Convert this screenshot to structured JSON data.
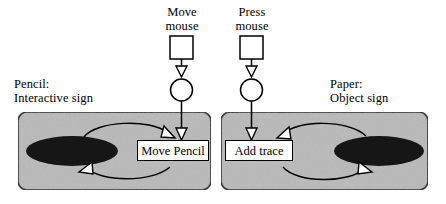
{
  "diagram": {
    "colors": {
      "panel_fill": "#b9b9b9",
      "panel_stroke": "#1a1a1a",
      "ellipse_fill": "#161616",
      "box_fill": "#ffffff",
      "stroke": "#000000"
    },
    "external_events": [
      {
        "id": "move-mouse",
        "label_line1": "Move",
        "label_line2": "mouse",
        "shapes": [
          "square",
          "arrow-down",
          "circle",
          "arrow-down"
        ]
      },
      {
        "id": "press-mouse",
        "label_line1": "Press",
        "label_line2": "mouse",
        "shapes": [
          "square",
          "arrow-down",
          "circle",
          "arrow-down"
        ]
      }
    ],
    "panels": [
      {
        "id": "pencil",
        "label_line1": "Pencil:",
        "label_line2": "Interactive sign",
        "ellipse_side": "left",
        "action_label": "Move Pencil"
      },
      {
        "id": "paper",
        "label_line1": "Paper:",
        "label_line2": "Object sign",
        "ellipse_side": "right",
        "action_label": "Add trace"
      }
    ]
  }
}
